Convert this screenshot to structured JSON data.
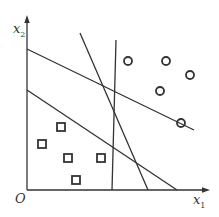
{
  "diagram": {
    "type": "linear-separators-2d",
    "colors": {
      "stroke": "#333333",
      "background": "#ffffff"
    },
    "axes": {
      "origin_label": "O",
      "x_label": "x",
      "x_subscript": "1",
      "y_label": "x",
      "y_subscript": "2"
    },
    "lines": [
      {
        "name": "separator-line-1",
        "x1": 27,
        "y1": 49,
        "x2": 194,
        "y2": 130
      },
      {
        "name": "separator-line-2",
        "x1": 27,
        "y1": 90,
        "x2": 177,
        "y2": 190
      },
      {
        "name": "separator-line-3",
        "x1": 80,
        "y1": 33,
        "x2": 148,
        "y2": 190
      },
      {
        "name": "separator-line-4",
        "x1": 116,
        "y1": 40,
        "x2": 112,
        "y2": 190
      }
    ],
    "class_circle": [
      {
        "cx": 128,
        "cy": 61
      },
      {
        "cx": 166,
        "cy": 61
      },
      {
        "cx": 190,
        "cy": 75
      },
      {
        "cx": 160,
        "cy": 91
      },
      {
        "cx": 181,
        "cy": 123
      }
    ],
    "class_square": [
      {
        "cx": 61,
        "cy": 127
      },
      {
        "cx": 42,
        "cy": 144
      },
      {
        "cx": 68,
        "cy": 158
      },
      {
        "cx": 101,
        "cy": 158
      },
      {
        "cx": 76,
        "cy": 180
      }
    ]
  }
}
